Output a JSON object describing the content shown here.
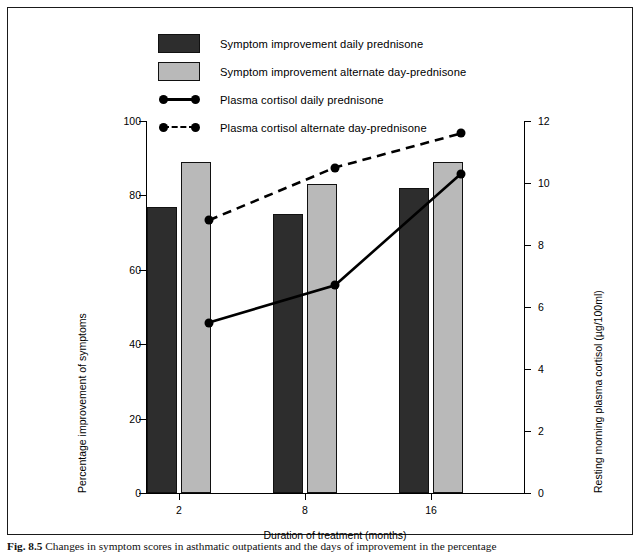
{
  "figure": {
    "caption_label": "Fig. 8.5",
    "caption_text": "Changes in symptom scores in asthmatic outpatients and the days of improvement in the percentage"
  },
  "legend": {
    "items": [
      {
        "marker": "dark-bar-swatch",
        "label": "Symptom improvement daily prednisone"
      },
      {
        "marker": "light-bar-swatch",
        "label": "Symptom improvement alternate day-prednisone"
      },
      {
        "marker": "solid-line-marker",
        "label": "Plasma cortisol daily prednisone"
      },
      {
        "marker": "dashed-line-marker",
        "label": "Plasma cortisol alternate day-prednisone"
      }
    ]
  },
  "chart_data": {
    "type": "bar",
    "title": "",
    "categories": [
      "2",
      "8",
      "16"
    ],
    "xlabel": "Duration of treatment (months)",
    "ylabel": "Percentage improvement of symptoms",
    "y2label": "Resting morning plasma cortisol (µg/100ml)",
    "ylim": [
      0,
      100
    ],
    "y2lim": [
      0,
      12
    ],
    "yticks": [
      "0",
      "20",
      "40",
      "60",
      "80",
      "100"
    ],
    "ytick_values": [
      0,
      20,
      40,
      60,
      80,
      100
    ],
    "y2ticks": [
      "0",
      "2",
      "4",
      "6",
      "8",
      "10",
      "12"
    ],
    "y2tick_values": [
      0,
      2,
      4,
      6,
      8,
      10,
      12
    ],
    "grid": false,
    "legend_position": "top",
    "bar_series": [
      {
        "name": "Symptom improvement daily prednisone",
        "color": "#2d2d2d",
        "axis": "left",
        "values": [
          77,
          75,
          82
        ]
      },
      {
        "name": "Symptom improvement alternate day-prednisone",
        "color": "#b9b9b9",
        "axis": "left",
        "values": [
          89,
          83,
          89
        ]
      }
    ],
    "line_series": [
      {
        "name": "Plasma cortisol daily prednisone",
        "style": "solid",
        "color": "#000000",
        "axis": "right",
        "values": [
          5.5,
          6.7,
          10.3
        ]
      },
      {
        "name": "Plasma cortisol alternate day-prednisone",
        "style": "dashed",
        "color": "#000000",
        "axis": "right",
        "values": [
          8.8,
          10.5,
          11.6
        ]
      }
    ]
  }
}
